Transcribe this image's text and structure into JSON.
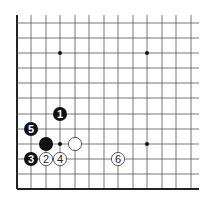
{
  "diagram": {
    "type": "go-board-corner",
    "grid": {
      "columns_x": [
        17,
        31,
        46,
        60,
        75,
        89,
        104,
        118,
        133,
        147,
        162,
        176,
        191
      ],
      "rows_y": [
        23,
        38,
        53,
        68,
        83,
        98,
        114,
        129,
        144,
        159,
        174,
        189
      ],
      "top_extent": 15,
      "right_extent": 199,
      "left_edge_x": 17,
      "bottom_edge_y": 189,
      "line_color": "#555555",
      "edge_color": "#222222"
    },
    "star_points": [
      {
        "x": 60,
        "y": 53
      },
      {
        "x": 147,
        "y": 53
      },
      {
        "x": 60,
        "y": 144
      },
      {
        "x": 147,
        "y": 144
      }
    ],
    "stones": [
      {
        "color": "black",
        "label": "1",
        "x": 60,
        "y": 114
      },
      {
        "color": "white",
        "label": "2",
        "x": 46,
        "y": 159
      },
      {
        "color": "black",
        "label": "3",
        "x": 31,
        "y": 159
      },
      {
        "color": "white",
        "label": "4",
        "x": 60,
        "y": 159
      },
      {
        "color": "black",
        "label": "5",
        "x": 31,
        "y": 129
      },
      {
        "color": "white",
        "label": "6",
        "x": 118,
        "y": 159
      },
      {
        "color": "black",
        "label": "",
        "x": 46,
        "y": 144
      },
      {
        "color": "white",
        "label": "",
        "x": 75,
        "y": 144
      }
    ],
    "colors": {
      "black_stone": "#111111",
      "white_stone": "#ffffff",
      "white_outline": "#333333"
    }
  }
}
